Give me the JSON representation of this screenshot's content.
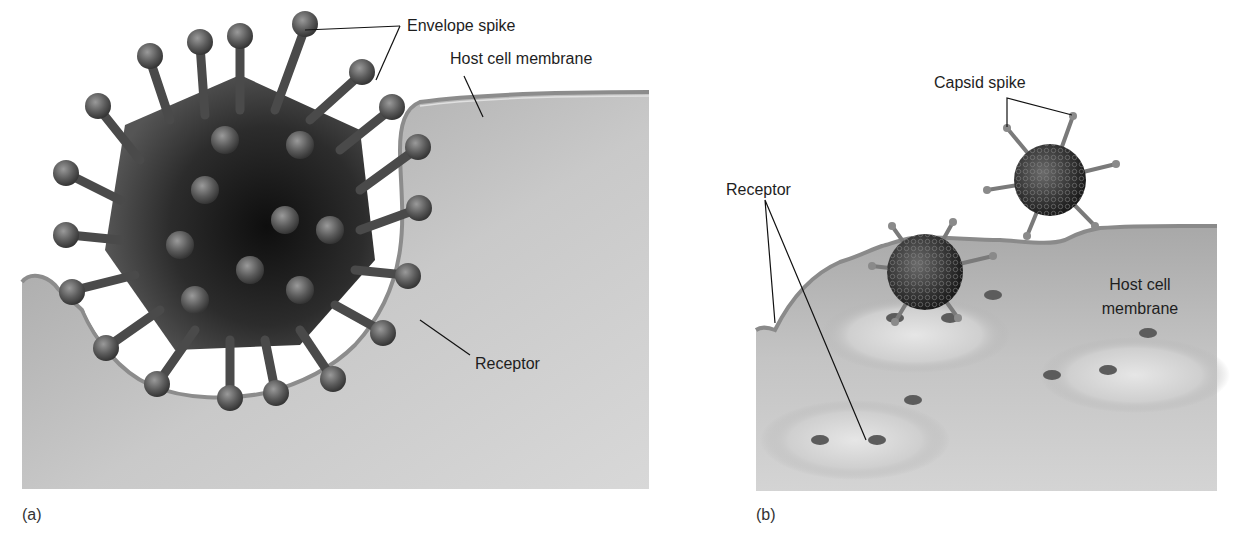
{
  "figure": {
    "panels": [
      {
        "id": "a",
        "tag": "(a)",
        "labels": {
          "envelope_spike": "Envelope spike",
          "host_cell_membrane": "Host cell membrane",
          "receptor": "Receptor"
        }
      },
      {
        "id": "b",
        "tag": "(b)",
        "labels": {
          "capsid_spike": "Capsid spike",
          "receptor": "Receptor",
          "host_cell_membrane_line1": "Host cell",
          "host_cell_membrane_line2": "membrane"
        }
      }
    ],
    "colors": {
      "background": "#ffffff",
      "cell_fill": "#bdbdbd",
      "virion_dark": "#1a1a1a",
      "spike": "#6a6a6a",
      "leader_line": "#111111"
    }
  }
}
